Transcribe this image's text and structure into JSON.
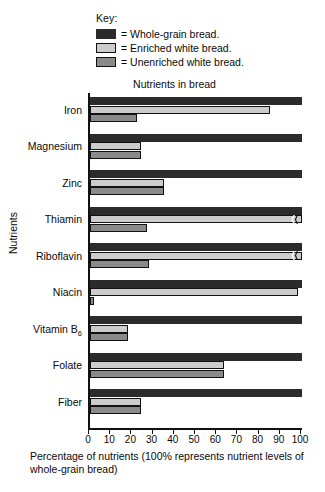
{
  "legend": {
    "title": "Key:",
    "equals": "=",
    "items": [
      {
        "label": "Whole-grain bread.",
        "color": "#2b2b2b"
      },
      {
        "label": "Enriched white bread.",
        "color": "#cccccc"
      },
      {
        "label": "Unenriched white bread.",
        "color": "#8a8a8a"
      }
    ]
  },
  "chart_data": {
    "type": "bar",
    "orientation": "horizontal",
    "title": "Nutrients in bread",
    "xlabel": "Percentage of nutrients (100% represents nutrient levels of whole-grain bread)",
    "ylabel": "Nutrients",
    "xlim": [
      0,
      100
    ],
    "xticks": [
      0,
      10,
      20,
      30,
      40,
      50,
      60,
      70,
      80,
      90,
      100
    ],
    "grid": false,
    "legend_position": "top",
    "categories": [
      "Iron",
      "Magnesium",
      "Zinc",
      "Thiamin",
      "Riboflavin",
      "Niacin",
      "Vitamin B6",
      "Folate",
      "Fiber"
    ],
    "category_labels_html": [
      "Iron",
      "Magnesium",
      "Zinc",
      "Thiamin",
      "Riboflavin",
      "Niacin",
      "Vitamin B<sub>6</sub>",
      "Folate",
      "Fiber"
    ],
    "series": [
      {
        "name": "Whole-grain bread.",
        "color": "#2b2b2b",
        "values": [
          100,
          100,
          100,
          100,
          100,
          100,
          100,
          100,
          100
        ]
      },
      {
        "name": "Enriched white bread.",
        "color": "#cccccc",
        "values": [
          85,
          24,
          35,
          100,
          100,
          98,
          18,
          63,
          24
        ],
        "broken_axis_marks": [
          false,
          false,
          false,
          true,
          true,
          false,
          false,
          false,
          false
        ]
      },
      {
        "name": "Unenriched white bread.",
        "color": "#8a8a8a",
        "values": [
          22,
          24,
          35,
          27,
          28,
          2,
          18,
          63,
          24
        ]
      }
    ]
  }
}
